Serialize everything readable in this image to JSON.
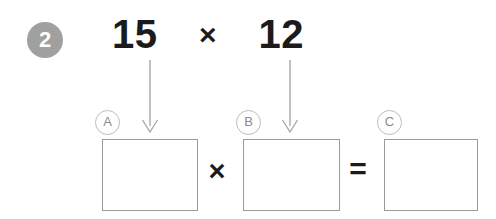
{
  "step": {
    "number": "2"
  },
  "expression": {
    "left_operand": "15",
    "operator": "×",
    "right_operand": "12"
  },
  "equation_row": {
    "operator_times": "×",
    "operator_equals": "="
  },
  "labels": [
    {
      "id": "a",
      "text": "A"
    },
    {
      "id": "b",
      "text": "B"
    },
    {
      "id": "c",
      "text": "C"
    }
  ],
  "answer_boxes": [
    {
      "id": "a",
      "value": ""
    },
    {
      "id": "b",
      "value": ""
    },
    {
      "id": "c",
      "value": ""
    }
  ],
  "colors": {
    "badge_fill": "#a0a0a0",
    "badge_text": "#ffffff",
    "ink": "#1b1b1b",
    "box_border": "#9a9a9a",
    "label_border": "#bdbdbd",
    "label_text": "#8c8c8c",
    "arrow": "#a8a8a8",
    "background": "#ffffff"
  }
}
